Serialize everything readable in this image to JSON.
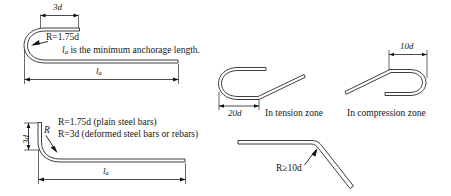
{
  "diagram": {
    "background_color": "#ffffff",
    "line_color": "#1d1d1d"
  },
  "figures": [
    {
      "id": "top-left-180-hook",
      "name": "180-degree-hook-with-anchorage-length",
      "labels": {
        "top_dimension": "3d",
        "radius": "R=1.75d",
        "note": "lₐ is the minimum anchorage length.",
        "note_plain_prefix": "l",
        "note_subscript": "a",
        "note_rest": " is the minimum anchorage length.",
        "bottom_dimension_base": "l",
        "bottom_dimension_sub": "a"
      }
    },
    {
      "id": "bottom-left-90-hook",
      "name": "90-degree-bend-with-anchorage-length",
      "labels": {
        "vertical_dimension": "3d",
        "radius_callout": "R",
        "radius_plain": "R=1.75d (plain steel bars)",
        "radius_deformed": "R=3d (deformed steel bars or rebars)",
        "bottom_dimension_base": "l",
        "bottom_dimension_sub": "a"
      }
    },
    {
      "id": "mid-tension-hook",
      "name": "tension-zone-hook",
      "labels": {
        "dimension": "20d",
        "caption": "In tension zone"
      }
    },
    {
      "id": "mid-compression-hook",
      "name": "compression-zone-hook",
      "labels": {
        "dimension": "10d",
        "caption": "In compression zone"
      }
    },
    {
      "id": "bottom-right-bent-bar",
      "name": "bent-up-bar-radius",
      "labels": {
        "radius": "R≥10d"
      }
    }
  ]
}
